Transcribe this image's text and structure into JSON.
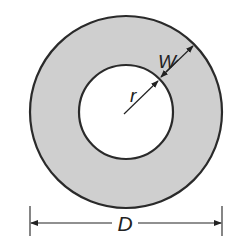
{
  "diagram": {
    "type": "annulus",
    "labels": {
      "width": "W",
      "radius": "r",
      "diameter": "D"
    },
    "colors": {
      "ring_fill": "#cfcfcf",
      "stroke": "#2a2a2a",
      "hole_fill": "#ffffff"
    }
  }
}
